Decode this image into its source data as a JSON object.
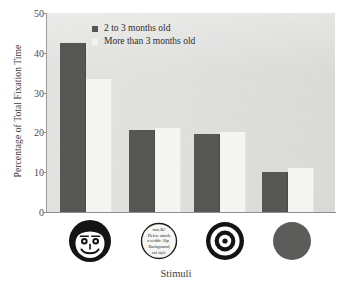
{
  "chart_data": {
    "type": "bar",
    "title": "",
    "xlabel": "Stimuli",
    "ylabel": "Percentage of Total Fixation Time",
    "ylim": [
      0,
      50
    ],
    "yticks": [
      0,
      10,
      20,
      30,
      40,
      50
    ],
    "grid": false,
    "legend_position": "top-center",
    "categories": [
      "face",
      "text-circle",
      "bullseye",
      "solid-disc"
    ],
    "category_labels": [
      "Face",
      "Text circle",
      "Bullseye",
      "Solid disc"
    ],
    "series": [
      {
        "name": "2 to 3 months old",
        "color": "#565654",
        "values": [
          42.5,
          20.5,
          19.5,
          10.0
        ]
      },
      {
        "name": "More than 3 months old",
        "color": "#f4f4f2",
        "values": [
          33.5,
          21.0,
          20.0,
          11.0
        ]
      }
    ]
  },
  "legend": {
    "items": [
      {
        "label": "2 to 3 months old",
        "swatch": "dark"
      },
      {
        "label": "More than 3 months old",
        "swatch": "light"
      }
    ]
  },
  "axes": {
    "y": {
      "title": "Percentage of Total Fixation Time",
      "ticks": [
        "0",
        "10",
        "20",
        "30",
        "40",
        "50"
      ]
    },
    "x": {
      "title": "Stimuli",
      "stimuli": [
        {
          "name": "smiling-face-icon",
          "caption": ""
        },
        {
          "name": "text-scramble-circle-icon",
          "caption": ""
        },
        {
          "name": "bullseye-target-icon",
          "caption": ""
        },
        {
          "name": "solid-disc-icon",
          "caption": ""
        }
      ]
    }
  },
  "colors": {
    "series_dark": "#565654",
    "series_light": "#f4f4f2",
    "plot_background": "#e0e0de",
    "axis": "#8e8e8c",
    "text": "#3b3b3b",
    "stimulus_ink": "#141414",
    "solid_disc": "#5c5c5a"
  }
}
